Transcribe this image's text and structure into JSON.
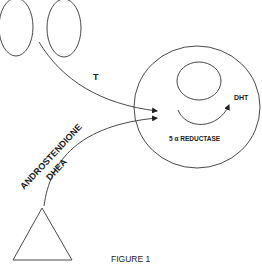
{
  "figure": {
    "caption": "FIGURE 1",
    "labels": {
      "t_arrow": "T",
      "androstendione": "ANDROSTENDIONE",
      "dhea": "DHEA",
      "dht": "DHT",
      "reductase": "5 α REDUCTASE"
    },
    "shapes": {
      "left_structures": "two ovals (testes)",
      "source_bottom": "triangle (adrenal)",
      "target_cell": "large circle with inner nucleus"
    },
    "colors": {
      "stroke": "#333333",
      "text": "#1a1a1a",
      "background": "#ffffff"
    }
  }
}
